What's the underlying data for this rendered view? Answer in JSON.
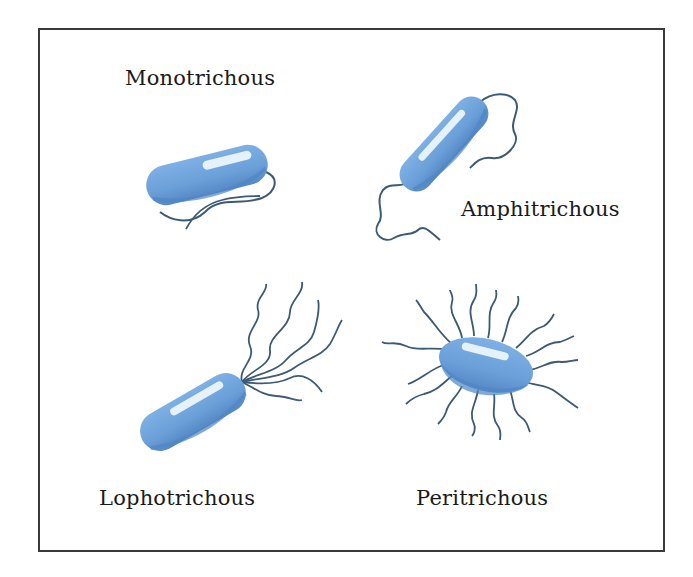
{
  "diagram": {
    "types": [
      {
        "id": "monotrichous",
        "label": "Monotrichous",
        "flagella_count": 1,
        "position": "top-left"
      },
      {
        "id": "amphitrichous",
        "label": "Amphitrichous",
        "flagella_count": 2,
        "position": "top-right"
      },
      {
        "id": "lophotrichous",
        "label": "Lophotrichous",
        "flagella_count": 6,
        "position": "bottom-left"
      },
      {
        "id": "peritrichous",
        "label": "Peritrichous",
        "flagella_count": 16,
        "position": "bottom-right"
      }
    ],
    "colors": {
      "cell_body": "#6a9fd8",
      "cell_shadow": "#4f86c6",
      "cell_highlight": "#e6f2fb",
      "flagellum": "#3c5a73",
      "frame": "#3a3a3a",
      "text": "#1a1a1a"
    }
  }
}
